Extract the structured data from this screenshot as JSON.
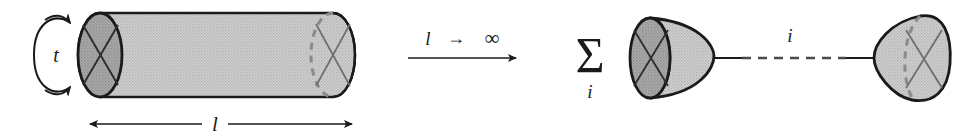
{
  "figure": {
    "caption_text": "",
    "background_color": "#ffffff",
    "ink_color": "#1a1a1a",
    "surface_fill": "#c6c6c6",
    "cap_fill": "#a2a2a2",
    "hidden_edge_color": "#8a8a8a"
  },
  "left_diagram": {
    "name": "cylinder-worldsheet",
    "modulus_label": "l",
    "time_label": "t",
    "time_loop_name": "closed-string-time-loop",
    "length_arrow_name": "length-dimension-arrow"
  },
  "transition": {
    "arrow_label": "l",
    "arrow_operator": "→",
    "arrow_limit": "∞",
    "arrow_label_full": "l → ∞"
  },
  "right_diagram": {
    "sum_symbol": "Σ",
    "sum_index": "i",
    "propagator_label": "i",
    "left_cap_name": "boundary-state-cap-left",
    "right_cap_name": "boundary-state-cap-right",
    "propagator_name": "dashed-propagator-line"
  }
}
